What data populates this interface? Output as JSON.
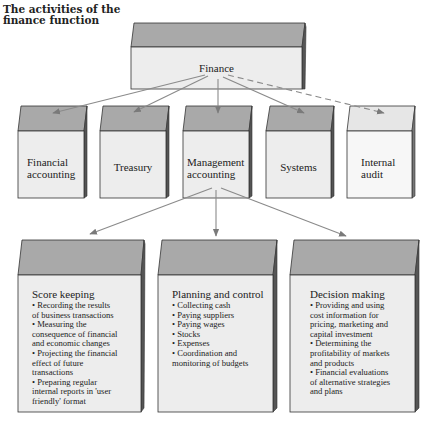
{
  "title": {
    "line1": "The activities of the",
    "line2": "finance function"
  },
  "root": {
    "label": "Finance"
  },
  "level1": [
    {
      "line1": "Financial",
      "line2": "accounting"
    },
    {
      "line1": "Treasury",
      "line2": ""
    },
    {
      "line1": "Management",
      "line2": "accounting"
    },
    {
      "line1": "Systems",
      "line2": ""
    },
    {
      "line1": "Internal",
      "line2": "audit",
      "style": "dashed-link"
    }
  ],
  "level2": [
    {
      "heading": "Score keeping",
      "lines": [
        "• Recording the results",
        "of business transactions",
        "• Measuring the",
        "consequence of financial",
        "and economic changes",
        "• Projecting the financial",
        "effect of future",
        "transactions",
        "• Preparing regular",
        "internal reports in 'user",
        "friendly' format"
      ]
    },
    {
      "heading": "Planning and control",
      "lines": [
        "• Collecting cash",
        "• Paying suppliers",
        "• Paying wages",
        "• Stocks",
        "• Expenses",
        "• Coordination and",
        "monitoring of budgets"
      ]
    },
    {
      "heading": "Decision making",
      "lines": [
        "• Providing and using",
        "cost information for",
        "pricing, marketing and",
        "capital investment",
        "• Determining the",
        "profitability of markets",
        "and products",
        "• Financial evaluations",
        "of alternative strategies",
        "and plans"
      ]
    }
  ],
  "colors": {
    "top_face": "#a9a9a9",
    "top_face_light": "#e6e6e6",
    "front_face": "#ededed",
    "front_face_light": "#f7f7f7",
    "side_face": "#555555",
    "line": "#8a8a8a"
  }
}
